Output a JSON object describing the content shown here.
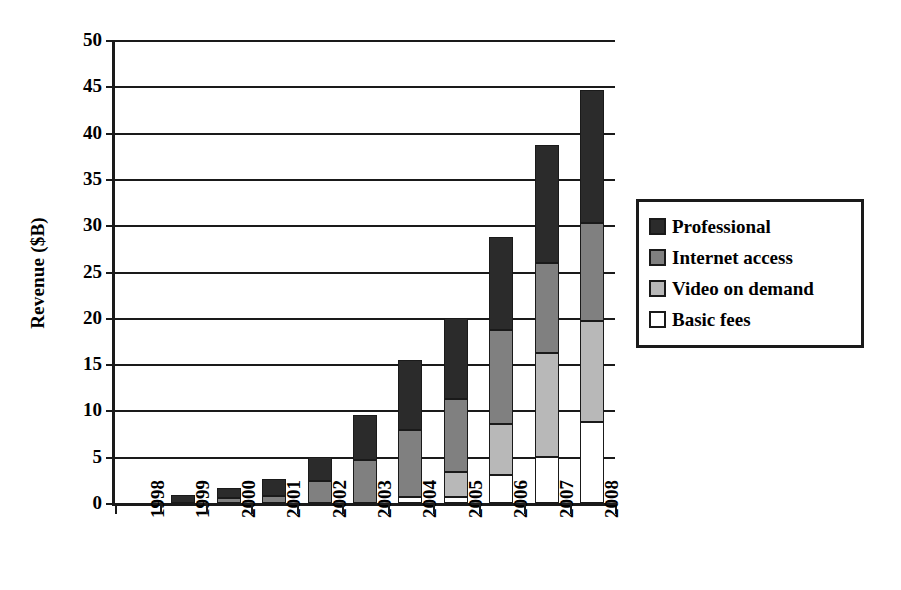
{
  "chart_data": {
    "type": "bar",
    "stacked": true,
    "title": "",
    "xlabel": "",
    "ylabel": "Revenue ($B)",
    "ylim": [
      0,
      50
    ],
    "ytick_step": 5,
    "yticks": [
      0,
      5,
      10,
      15,
      20,
      25,
      30,
      35,
      40,
      45,
      50
    ],
    "ytick_labels": [
      "0",
      "5",
      "10",
      "15",
      "20",
      "25",
      "30",
      "35",
      "40",
      "45",
      "50"
    ],
    "grid": true,
    "grid_axis": "y",
    "legend_position": "right",
    "categories": [
      "1998",
      "1999",
      "2000",
      "2001",
      "2002",
      "2003",
      "2004",
      "2005",
      "2006",
      "2007",
      "2008"
    ],
    "series": [
      {
        "name": "Basic fees",
        "color": "#ffffff",
        "swatch": "sw-basic",
        "values": [
          0,
          0,
          0,
          0,
          0,
          0,
          0.6,
          0.7,
          3.0,
          5.0,
          8.7
        ]
      },
      {
        "name": "Video on demand",
        "color": "#b8b8b8",
        "swatch": "sw-video",
        "values": [
          0,
          0,
          0,
          0,
          0,
          0,
          0,
          2.6,
          5.5,
          11.2,
          11.0
        ]
      },
      {
        "name": "Internet access",
        "color": "#808080",
        "swatch": "sw-internet",
        "values": [
          0,
          0,
          0.5,
          0.8,
          2.4,
          4.6,
          7.3,
          7.9,
          10.2,
          9.7,
          10.5
        ]
      },
      {
        "name": "Professional",
        "color": "#2b2b2b",
        "swatch": "sw-professional",
        "values": [
          0,
          0.9,
          1.1,
          1.8,
          2.6,
          4.9,
          7.5,
          8.8,
          10.0,
          12.8,
          14.4
        ]
      }
    ],
    "totals": [
      0,
      0.9,
      1.6,
      2.6,
      5.0,
      9.5,
      15.4,
      20.0,
      28.7,
      38.7,
      44.6
    ]
  },
  "legend": {
    "entries": [
      {
        "label": "Professional",
        "swatch": "sw-professional"
      },
      {
        "label": "Internet access",
        "swatch": "sw-internet"
      },
      {
        "label": "Video on demand",
        "swatch": "sw-video"
      },
      {
        "label": "Basic fees",
        "swatch": "sw-basic"
      }
    ]
  },
  "colors": {
    "axis": "#1a1a1a",
    "professional": "#2b2b2b",
    "internet_access": "#808080",
    "video_on_demand": "#b8b8b8",
    "basic_fees": "#ffffff",
    "background": "#ffffff"
  }
}
